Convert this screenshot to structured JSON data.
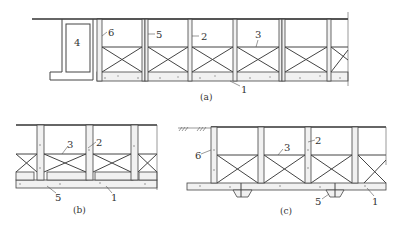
{
  "figure": {
    "subfigures": [
      {
        "id": "a",
        "caption": "(a)",
        "callouts": [
          "1",
          "2",
          "3",
          "4",
          "5",
          "6"
        ]
      },
      {
        "id": "b",
        "caption": "(b)",
        "callouts": [
          "1",
          "2",
          "3",
          "5"
        ]
      },
      {
        "id": "c",
        "caption": "(c)",
        "callouts": [
          "1",
          "2",
          "3",
          "5",
          "6"
        ]
      }
    ],
    "labels": {
      "a_4": "4",
      "a_6": "6",
      "a_5": "5",
      "a_2": "2",
      "a_3": "3",
      "a_1": "1",
      "b_3": "3",
      "b_2": "2",
      "b_5": "5",
      "b_1": "1",
      "c_6": "6",
      "c_3": "3",
      "c_2": "2",
      "c_5": "5",
      "c_1": "1"
    },
    "colors": {
      "line": "#444444",
      "concrete_fill": "#f1f1f1",
      "background": "#ffffff"
    }
  }
}
